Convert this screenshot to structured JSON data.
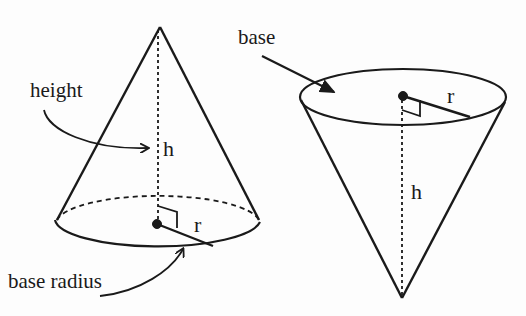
{
  "left_cone": {
    "label_height": "height",
    "label_base_radius": "base radius",
    "var_h": "h",
    "var_r": "r"
  },
  "right_cone": {
    "label_base": "base",
    "var_h": "h",
    "var_r": "r"
  },
  "colors": {
    "stroke": "#1a1a1a",
    "background": "#fdfdfd"
  }
}
